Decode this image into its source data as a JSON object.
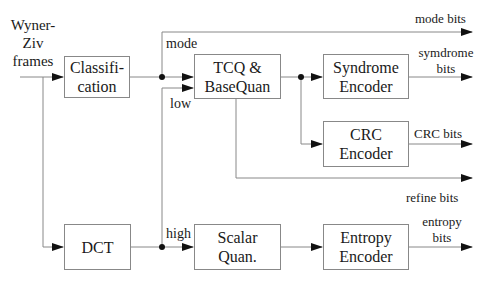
{
  "diagram": {
    "input_label": [
      "Wyner-",
      "Ziv",
      "frames"
    ],
    "blocks": {
      "classification": [
        "Classifi-",
        "cation"
      ],
      "tcq": [
        "TCQ &",
        "BaseQuan"
      ],
      "syndrome": [
        "Syndrome",
        "Encoder"
      ],
      "crc": [
        "CRC",
        "Encoder"
      ],
      "dct": [
        "DCT"
      ],
      "scalar": [
        "Scalar",
        "Quan."
      ],
      "entropy": [
        "Entropy",
        "Encoder"
      ]
    },
    "edge_labels": {
      "mode": "mode",
      "low": "low",
      "high": "high"
    },
    "outputs": {
      "mode_bits": "mode bits",
      "syndrome_bits": [
        "symdrome",
        "bits"
      ],
      "crc_bits": "CRC bits",
      "refine_bits": "refine bits",
      "entropy_bits": [
        "entropy",
        "bits"
      ]
    },
    "colors": {
      "line": "#888888",
      "arrow": "#111111",
      "text": "#1a1a1a"
    }
  }
}
